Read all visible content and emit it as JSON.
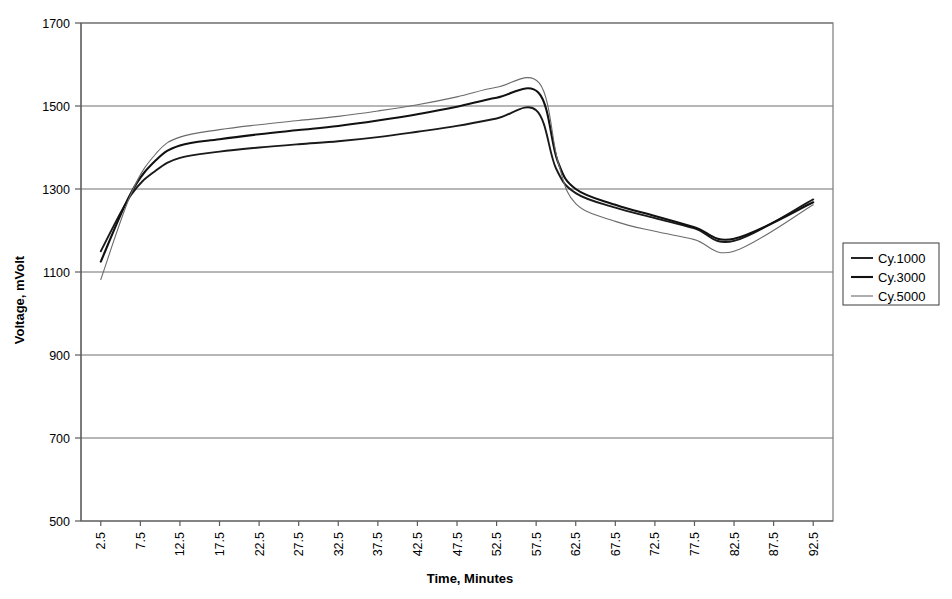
{
  "chart_data": {
    "type": "line",
    "title": "",
    "xlabel": "Time, Minutes",
    "ylabel": "Voltage, mVolt",
    "xlim": [
      0,
      95
    ],
    "ylim": [
      500,
      1700
    ],
    "yticks": [
      500,
      700,
      900,
      1100,
      1300,
      1500,
      1700
    ],
    "ytick_labels": [
      "500",
      "700",
      "900",
      "1100",
      "1300",
      "1500",
      "1700"
    ],
    "grid": "horizontal",
    "legend_position": "right",
    "x": [
      2.5,
      7.5,
      12.5,
      17.5,
      22.5,
      27.5,
      32.5,
      37.5,
      42.5,
      47.5,
      52.5,
      57.5,
      62.5,
      67.5,
      72.5,
      77.5,
      82.5,
      87.5,
      92.5
    ],
    "xtick_labels": [
      "2.5",
      "7.5",
      "12.5",
      "17.5",
      "22.5",
      "27.5",
      "32.5",
      "37.5",
      "42.5",
      "47.5",
      "52.5",
      "57.5",
      "62.5",
      "67.5",
      "72.5",
      "77.5",
      "82.5",
      "87.5",
      "92.5"
    ],
    "series": [
      {
        "name": "Cy.1000",
        "color": "#1a1a1a",
        "width": 1.9,
        "dash": "none",
        "values": [
          1150,
          1285,
          1345,
          1375,
          1390,
          1400,
          1408,
          1415,
          1425,
          1438,
          1452,
          1470,
          1490,
          1350,
          1290,
          1255,
          1230,
          1205,
          1175,
          1275
        ],
        "x": [
          2.5,
          6.3,
          9.5,
          12.5,
          17.5,
          22.5,
          27.5,
          32.5,
          37.5,
          42.5,
          47.5,
          52.5,
          57.5,
          60.0,
          62.5,
          67.5,
          72.5,
          77.5,
          82.5,
          92.5
        ]
      },
      {
        "name": "Cy.3000",
        "color": "#111111",
        "width": 2.1,
        "dash": "none",
        "values": [
          1125,
          1290,
          1370,
          1405,
          1420,
          1432,
          1442,
          1452,
          1465,
          1480,
          1498,
          1520,
          1532,
          1368,
          1300,
          1262,
          1235,
          1208,
          1180,
          1268
        ],
        "x": [
          2.5,
          6.3,
          9.5,
          12.5,
          17.5,
          22.5,
          27.5,
          32.5,
          37.5,
          42.5,
          47.5,
          52.5,
          57.8,
          60.2,
          62.5,
          67.5,
          72.5,
          77.5,
          82.5,
          92.5
        ]
      },
      {
        "name": "Cy.5000",
        "color": "#6b6b6b",
        "width": 1.1,
        "dash": "none",
        "values": [
          1082,
          1292,
          1388,
          1425,
          1443,
          1455,
          1465,
          1475,
          1488,
          1503,
          1522,
          1545,
          1555,
          1362,
          1265,
          1222,
          1198,
          1178,
          1150,
          1262
        ],
        "x": [
          2.5,
          6.4,
          9.6,
          12.5,
          17.5,
          22.5,
          27.5,
          32.5,
          37.5,
          42.5,
          47.5,
          52.5,
          57.9,
          60.3,
          62.5,
          67.5,
          72.5,
          77.5,
          82.5,
          92.5
        ]
      }
    ]
  },
  "legend": {
    "entries": [
      {
        "label": "Cy.1000"
      },
      {
        "label": "Cy.3000"
      },
      {
        "label": "Cy.5000"
      }
    ]
  }
}
